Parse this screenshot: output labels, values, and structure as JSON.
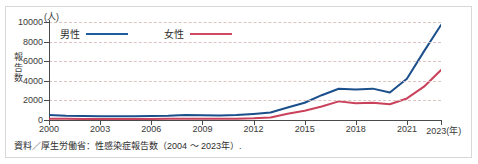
{
  "figure": {
    "unit_label": "(人)",
    "y_axis_title": "報告数",
    "caption": "資料／厚生労働省：性感染症報告数（2004 ～ 2023年）."
  },
  "legend": {
    "items": [
      {
        "label": "男性",
        "color": "#1f5c9e"
      },
      {
        "label": "女性",
        "color": "#cf4b63"
      }
    ]
  },
  "colors": {
    "male_line": "#1b4f8c",
    "female_line": "#c9415b",
    "axis": "#4a4a4a",
    "grid": "#d9b9b9",
    "frame": "#d8d8d8",
    "text": "#3a3a3a"
  },
  "chart_data": {
    "type": "line",
    "title": "",
    "subtitle": "",
    "xlabel": "年",
    "ylabel": "報告数",
    "unit": "人",
    "xlim": [
      2000,
      2023
    ],
    "ylim": [
      0,
      10000
    ],
    "ytick_values": [
      0,
      2000,
      4000,
      6000,
      8000,
      10000
    ],
    "ytick_labels": [
      "0",
      "2000",
      "4000",
      "6000",
      "8000",
      "10000"
    ],
    "xtick_values": [
      2000,
      2003,
      2006,
      2009,
      2012,
      2015,
      2018,
      2021,
      2023
    ],
    "xtick_labels": [
      "2000",
      "2003",
      "2006",
      "2009",
      "2012",
      "2015",
      "2018",
      "2021",
      "2023(年)"
    ],
    "grid": true,
    "grid_axis": "y",
    "grid_style": "dashed",
    "legend_position": "top-left",
    "x": [
      2000,
      2001,
      2002,
      2003,
      2004,
      2005,
      2006,
      2007,
      2008,
      2009,
      2010,
      2011,
      2012,
      2013,
      2014,
      2015,
      2016,
      2017,
      2018,
      2019,
      2020,
      2021,
      2022,
      2023
    ],
    "series": [
      {
        "name": "男性",
        "color": "#1b4f8c",
        "values": [
          500,
          430,
          400,
          390,
          380,
          390,
          400,
          430,
          500,
          480,
          450,
          500,
          620,
          760,
          1280,
          1760,
          2530,
          3190,
          3100,
          3200,
          2800,
          4200,
          7000,
          9700
        ]
      },
      {
        "name": "女性",
        "color": "#c9415b",
        "values": [
          130,
          120,
          110,
          110,
          110,
          110,
          110,
          120,
          130,
          130,
          130,
          140,
          170,
          250,
          640,
          940,
          1380,
          1900,
          1700,
          1750,
          1600,
          2200,
          3400,
          5100
        ]
      }
    ]
  }
}
